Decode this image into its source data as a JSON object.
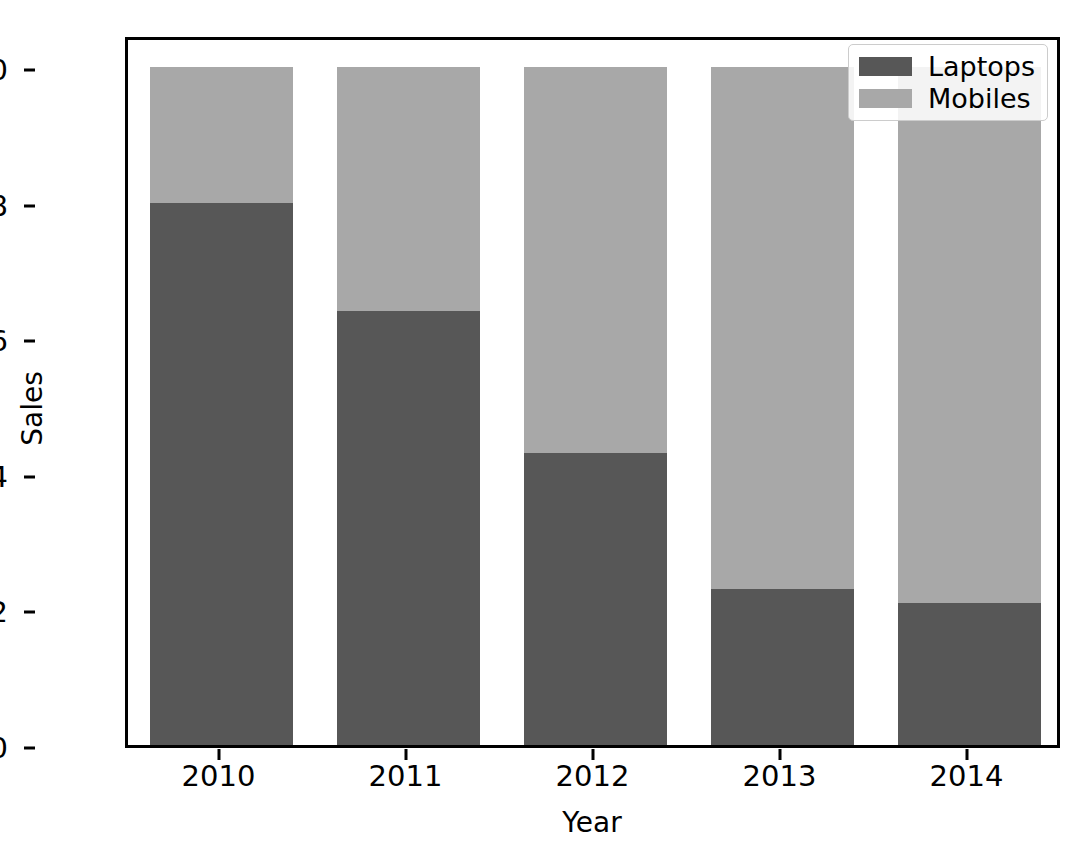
{
  "chart_data": {
    "type": "bar",
    "subtype": "stacked",
    "title": "",
    "xlabel": "Year",
    "ylabel": "Sales",
    "categories": [
      "2010",
      "2011",
      "2012",
      "2013",
      "2014"
    ],
    "series": [
      {
        "name": "Laptops",
        "color": "#575757",
        "values": [
          0.8,
          0.64,
          0.43,
          0.23,
          0.21
        ]
      },
      {
        "name": "Mobiles",
        "color": "#a8a8a8",
        "values": [
          0.2,
          0.36,
          0.57,
          0.77,
          0.79
        ]
      }
    ],
    "ylim": [
      0.0,
      1.0
    ],
    "yticks": [
      "0.0",
      "0.2",
      "0.4",
      "0.6",
      "0.8",
      "1.0"
    ],
    "ytick_values": [
      0.0,
      0.2,
      0.4,
      0.6,
      0.8,
      1.0
    ],
    "xticks": [
      "2010",
      "2011",
      "2012",
      "2013",
      "2014"
    ],
    "grid": false,
    "legend_position": "upper right",
    "legend_entries": [
      "Laptops",
      "Mobiles"
    ]
  },
  "axes": {
    "y_label": "Sales",
    "x_label": "Year"
  },
  "legend": {
    "items": [
      {
        "label": "Laptops",
        "color": "#575757"
      },
      {
        "label": "Mobiles",
        "color": "#a8a8a8"
      }
    ]
  },
  "colors": {
    "laptops": "#575757",
    "mobiles": "#a8a8a8",
    "axis": "#000000",
    "background": "#ffffff",
    "legend_border": "#cccccc"
  }
}
